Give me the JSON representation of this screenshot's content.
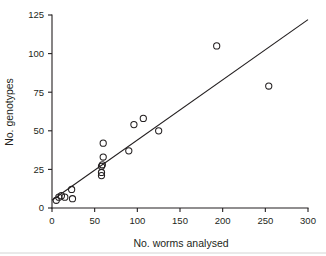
{
  "figure": {
    "title": "",
    "background_color": "#ffffff",
    "ink_color": "#231f20"
  },
  "chart_data": {
    "type": "scatter",
    "title": "",
    "xlabel": "No. worms analysed",
    "ylabel": "No. genotypes",
    "xlim": [
      0,
      300
    ],
    "ylim": [
      0,
      125
    ],
    "xticks": [
      0,
      50,
      100,
      150,
      200,
      250,
      300
    ],
    "yticks": [
      0,
      25,
      50,
      75,
      100,
      125
    ],
    "xtick_labels": [
      "0",
      "50",
      "100",
      "150",
      "200",
      "250",
      "300"
    ],
    "ytick_labels": [
      "0",
      "25",
      "50",
      "75",
      "100",
      "125"
    ],
    "grid": false,
    "legend": null,
    "marker": "open-circle",
    "series": [
      {
        "name": "observations",
        "marker": "open-circle",
        "points": [
          {
            "x": 5,
            "y": 5
          },
          {
            "x": 8,
            "y": 7
          },
          {
            "x": 11,
            "y": 8
          },
          {
            "x": 15,
            "y": 7
          },
          {
            "x": 23,
            "y": 12
          },
          {
            "x": 24,
            "y": 6
          },
          {
            "x": 58,
            "y": 21
          },
          {
            "x": 58,
            "y": 23
          },
          {
            "x": 58,
            "y": 27
          },
          {
            "x": 59,
            "y": 28
          },
          {
            "x": 60,
            "y": 33
          },
          {
            "x": 60,
            "y": 42
          },
          {
            "x": 90,
            "y": 37
          },
          {
            "x": 96,
            "y": 54
          },
          {
            "x": 107,
            "y": 58
          },
          {
            "x": 125,
            "y": 50
          },
          {
            "x": 193,
            "y": 105
          },
          {
            "x": 254,
            "y": 79
          }
        ]
      }
    ],
    "fit_line": {
      "name": "regression-line",
      "x0": 0,
      "y0": 5,
      "x1": 300,
      "y1": 122
    }
  }
}
